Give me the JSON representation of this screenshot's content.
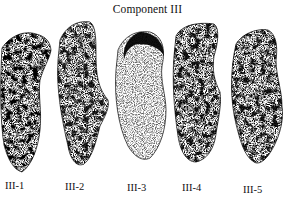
{
  "figure": {
    "title": "Component III",
    "items": [
      {
        "label": "III-1"
      },
      {
        "label": "III-2"
      },
      {
        "label": "III-3"
      },
      {
        "label": "III-4"
      },
      {
        "label": "III-5"
      }
    ]
  }
}
